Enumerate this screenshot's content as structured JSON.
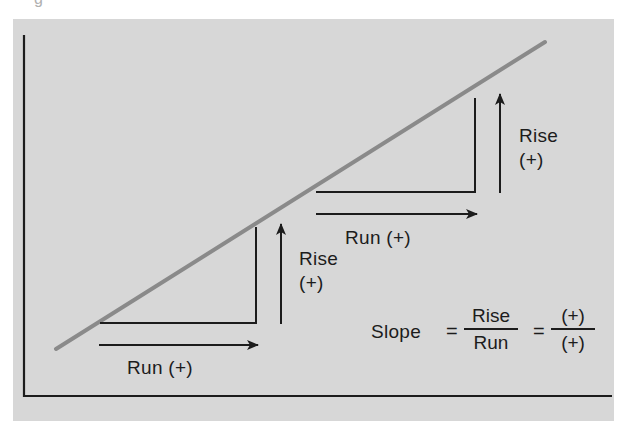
{
  "caption_fragment": "g",
  "colors": {
    "panel_bg": "#d7d7d7",
    "line": "#8a8a8a",
    "ink": "#1c1c1c"
  },
  "diagram": {
    "type": "slope-illustration",
    "line": {
      "from": [
        56,
        349
      ],
      "to": [
        545,
        42
      ],
      "color": "#8a8a8a",
      "description": "positively sloped straight line"
    },
    "axes": {
      "y_axis": {
        "x": 24,
        "top": 35,
        "bottom": 396
      },
      "x_axis": {
        "y": 396,
        "left": 23,
        "right": 612
      }
    },
    "triangles": [
      {
        "id": "lower",
        "run_label": "Run (+)",
        "rise_label_line1": "Rise",
        "rise_label_line2": "(+)"
      },
      {
        "id": "upper",
        "run_label": "Run (+)",
        "rise_label_line1": "Rise",
        "rise_label_line2": "(+)"
      }
    ],
    "formula": {
      "lhs": "Slope",
      "eq1": "=",
      "frac1_num": "Rise",
      "frac1_den": "Run",
      "eq2": "=",
      "frac2_num": "(+)",
      "frac2_den": "(+)"
    }
  }
}
